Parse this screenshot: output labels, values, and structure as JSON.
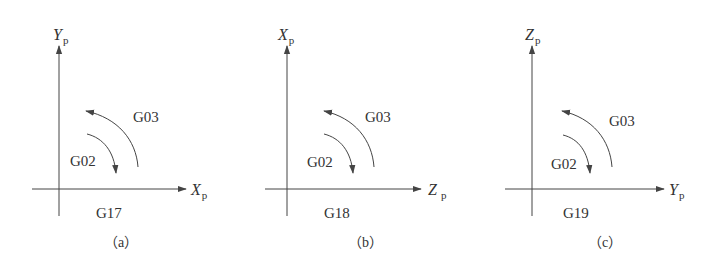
{
  "figure": {
    "panels": [
      {
        "id": "a",
        "vertical_axis": {
          "letter": "Y",
          "subscript": "p"
        },
        "horizontal_axis": {
          "letter": "X",
          "subscript": "p"
        },
        "plane_code": "G17",
        "cw_label": "G02",
        "ccw_label": "G03",
        "caption": "（a）"
      },
      {
        "id": "b",
        "vertical_axis": {
          "letter": "X",
          "subscript": "p"
        },
        "horizontal_axis": {
          "letter": "Z",
          "subscript": "p"
        },
        "plane_code": "G18",
        "cw_label": "G02",
        "ccw_label": "G03",
        "caption": "（b）"
      },
      {
        "id": "c",
        "vertical_axis": {
          "letter": "Z",
          "subscript": "p"
        },
        "horizontal_axis": {
          "letter": "Y",
          "subscript": "p"
        },
        "plane_code": "G19",
        "cw_label": "G02",
        "ccw_label": "G03",
        "caption": "（c）"
      }
    ],
    "colors": {
      "line": "#444444",
      "text": "#333333",
      "background": "#ffffff"
    }
  }
}
